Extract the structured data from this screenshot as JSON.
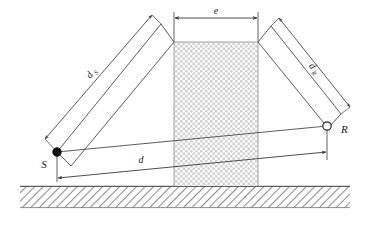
{
  "figure": {
    "background_color": "#ffffff",
    "line_color": "#3a3a3a",
    "ground_color": "#8a8a8a",
    "building_fill": "#d9d9d9"
  },
  "labels": {
    "source_point": "S",
    "receiver_point": "R",
    "distance_total": "d",
    "obstacle_width": "e",
    "dist_source_main": "d",
    "dist_source_sub": "S",
    "dist_receiver_main": "d",
    "dist_receiver_sub": "R"
  },
  "markers": {
    "source_style": "filled-circle",
    "receiver_style": "open-circle"
  },
  "elements": {
    "obstacle_name": "building-block",
    "ground_name": "ground-hatching",
    "sight_line_name": "direct-path-line"
  },
  "geometry": {
    "source_x": 57,
    "source_y": 152,
    "receiver_x": 327,
    "receiver_y": 126,
    "building_left": 174,
    "building_right": 258,
    "building_top": 42,
    "building_bottom": 186,
    "ground_top": 186,
    "ground_bottom": 208
  }
}
